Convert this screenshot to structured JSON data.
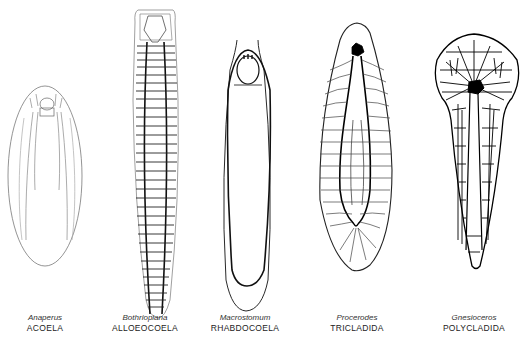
{
  "figure": {
    "specimens": [
      {
        "genus": "Anaperus",
        "order": "ACOELA",
        "center_x": 45
      },
      {
        "genus": "Bothrioplana",
        "order": "ALLOEOCOELA",
        "center_x": 145
      },
      {
        "genus": "Macrostomum",
        "order": "RHABDOCOELA",
        "center_x": 245
      },
      {
        "genus": "Procerodes",
        "order": "TRICLADIDA",
        "center_x": 357
      },
      {
        "genus": "Gnesioceros",
        "order": "POLYCLADIDA",
        "center_x": 474
      }
    ]
  }
}
